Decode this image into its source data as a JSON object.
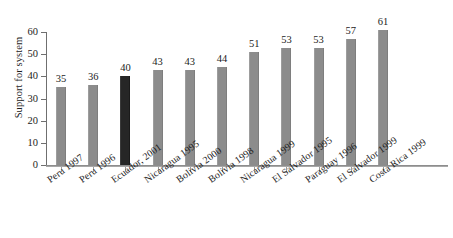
{
  "chart_data": {
    "type": "bar",
    "title": "",
    "subtitle": "",
    "xlabel": "",
    "ylabel": "Support for system",
    "ylim": [
      0,
      60
    ],
    "yticks": [
      0,
      10,
      20,
      30,
      40,
      50,
      60
    ],
    "grid": false,
    "legend": "none",
    "categories": [
      "Peru 1997",
      "Peru 1996",
      "Ecuador, 2001",
      "Nicaragua 1995",
      "Bolivia 2000",
      "Bolivia 1998",
      "Nicaragua 1999",
      "El Salvador 1995",
      "Paraguay 1996",
      "El Salvador 1999",
      "Costa Rica 1999"
    ],
    "values": [
      35,
      36,
      40,
      43,
      43,
      44,
      51,
      53,
      53,
      57,
      61
    ],
    "value_labels": [
      "35",
      "36",
      "40",
      "43",
      "43",
      "44",
      "51",
      "53",
      "53",
      "57",
      "61"
    ],
    "tick_labels": [
      "0",
      "10",
      "20",
      "30",
      "40",
      "50",
      "60"
    ],
    "bar_colors": [
      "#8c8c8c",
      "#8c8c8c",
      "#262626",
      "#8c8c8c",
      "#8c8c8c",
      "#8c8c8c",
      "#8c8c8c",
      "#8c8c8c",
      "#8c8c8c",
      "#8c8c8c",
      "#8c8c8c"
    ],
    "highlight_index": 2,
    "highlight_color": "#262626",
    "series_color": "#8c8c8c",
    "axis_color": "#6f6f6f",
    "background": "#ffffff"
  }
}
